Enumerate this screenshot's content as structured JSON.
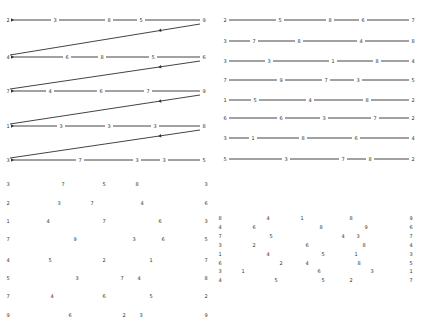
{
  "panels": {
    "top_left": {
      "type": "linked-rows-with-return-arrows",
      "rows": [
        {
          "y": 20,
          "digits": [
            "2",
            "3",
            "8",
            "5",
            "9"
          ],
          "x": [
            8,
            55,
            109,
            141,
            204
          ]
        },
        {
          "y": 57,
          "digits": [
            "4",
            "6",
            "8",
            "5",
            "6"
          ],
          "x": [
            8,
            67,
            102,
            153,
            204
          ]
        },
        {
          "y": 91,
          "digits": [
            "7",
            "4",
            "6",
            "7",
            "9"
          ],
          "x": [
            8,
            50,
            101,
            148,
            204
          ]
        },
        {
          "y": 126,
          "digits": [
            "1",
            "3",
            "3",
            "3",
            "8"
          ],
          "x": [
            8,
            61,
            109,
            155,
            204
          ]
        },
        {
          "y": 160,
          "digits": [
            "3",
            "7",
            "3",
            "3",
            "5"
          ],
          "x": [
            8,
            80,
            137,
            164,
            204
          ]
        }
      ]
    },
    "top_right": {
      "type": "linked-rows",
      "rows": [
        {
          "y": 20,
          "digits": [
            "2",
            "5",
            "8",
            "6",
            "7"
          ],
          "x": [
            10,
            65,
            115,
            148,
            198
          ]
        },
        {
          "y": 41,
          "digits": [
            "3",
            "7",
            "8",
            "4",
            "8"
          ],
          "x": [
            10,
            39,
            84,
            146,
            198
          ]
        },
        {
          "y": 61,
          "digits": [
            "3",
            "3",
            "1",
            "8",
            "4"
          ],
          "x": [
            10,
            54,
            118,
            162,
            198
          ]
        },
        {
          "y": 80,
          "digits": [
            "7",
            "9",
            "7",
            "3",
            "5"
          ],
          "x": [
            10,
            66,
            111,
            143,
            198
          ]
        },
        {
          "y": 100,
          "digits": [
            "1",
            "5",
            "4",
            "8",
            "2"
          ],
          "x": [
            10,
            40,
            95,
            152,
            198
          ]
        },
        {
          "y": 118,
          "digits": [
            "6",
            "6",
            "3",
            "7",
            "2"
          ],
          "x": [
            10,
            66,
            109,
            160,
            198
          ]
        },
        {
          "y": 138,
          "digits": [
            "3",
            "1",
            "8",
            "6",
            "4"
          ],
          "x": [
            10,
            38,
            88,
            141,
            198
          ]
        },
        {
          "y": 159,
          "digits": [
            "5",
            "3",
            "7",
            "8",
            "2"
          ],
          "x": [
            10,
            71,
            128,
            155,
            198
          ]
        }
      ]
    },
    "bottom_left": {
      "type": "scattered-digits",
      "items": [
        {
          "t": "3",
          "x": 8,
          "y": 14
        },
        {
          "t": "7",
          "x": 63,
          "y": 14
        },
        {
          "t": "5",
          "x": 104,
          "y": 14
        },
        {
          "t": "8",
          "x": 137,
          "y": 14
        },
        {
          "t": "3",
          "x": 206,
          "y": 14
        },
        {
          "t": "2",
          "x": 8,
          "y": 33
        },
        {
          "t": "3",
          "x": 59,
          "y": 33
        },
        {
          "t": "7",
          "x": 92,
          "y": 33
        },
        {
          "t": "4",
          "x": 142,
          "y": 33
        },
        {
          "t": "6",
          "x": 206,
          "y": 33
        },
        {
          "t": "1",
          "x": 8,
          "y": 51
        },
        {
          "t": "4",
          "x": 48,
          "y": 51
        },
        {
          "t": "7",
          "x": 104,
          "y": 51
        },
        {
          "t": "6",
          "x": 160,
          "y": 51
        },
        {
          "t": "3",
          "x": 206,
          "y": 51
        },
        {
          "t": "7",
          "x": 8,
          "y": 69
        },
        {
          "t": "9",
          "x": 75,
          "y": 69
        },
        {
          "t": "3",
          "x": 134,
          "y": 69
        },
        {
          "t": "6",
          "x": 163,
          "y": 69
        },
        {
          "t": "5",
          "x": 206,
          "y": 69
        },
        {
          "t": "4",
          "x": 8,
          "y": 90
        },
        {
          "t": "5",
          "x": 50,
          "y": 90
        },
        {
          "t": "2",
          "x": 104,
          "y": 90
        },
        {
          "t": "1",
          "x": 151,
          "y": 90
        },
        {
          "t": "7",
          "x": 206,
          "y": 90
        },
        {
          "t": "5",
          "x": 8,
          "y": 108
        },
        {
          "t": "3",
          "x": 77,
          "y": 108
        },
        {
          "t": "7",
          "x": 122,
          "y": 108
        },
        {
          "t": "4",
          "x": 139,
          "y": 108
        },
        {
          "t": "8",
          "x": 206,
          "y": 108
        },
        {
          "t": "7",
          "x": 8,
          "y": 126
        },
        {
          "t": "4",
          "x": 52,
          "y": 126
        },
        {
          "t": "6",
          "x": 104,
          "y": 126
        },
        {
          "t": "5",
          "x": 151,
          "y": 126
        },
        {
          "t": "2",
          "x": 206,
          "y": 126
        },
        {
          "t": "9",
          "x": 8,
          "y": 145
        },
        {
          "t": "6",
          "x": 70,
          "y": 145
        },
        {
          "t": "2",
          "x": 124,
          "y": 145
        },
        {
          "t": "3",
          "x": 141,
          "y": 145
        },
        {
          "t": "9",
          "x": 206,
          "y": 145
        }
      ]
    },
    "bottom_right": {
      "type": "scattered-digits",
      "items": [
        {
          "t": "8",
          "x": 5,
          "y": 48
        },
        {
          "t": "4",
          "x": 53,
          "y": 48
        },
        {
          "t": "1",
          "x": 87,
          "y": 48
        },
        {
          "t": "8",
          "x": 136,
          "y": 48
        },
        {
          "t": "9",
          "x": 196,
          "y": 48
        },
        {
          "t": "4",
          "x": 5,
          "y": 57
        },
        {
          "t": "6",
          "x": 39,
          "y": 57
        },
        {
          "t": "8",
          "x": 106,
          "y": 57
        },
        {
          "t": "9",
          "x": 151,
          "y": 57
        },
        {
          "t": "6",
          "x": 196,
          "y": 57
        },
        {
          "t": "7",
          "x": 5,
          "y": 66
        },
        {
          "t": "5",
          "x": 56,
          "y": 66
        },
        {
          "t": "4",
          "x": 128,
          "y": 66
        },
        {
          "t": "3",
          "x": 143,
          "y": 66
        },
        {
          "t": "7",
          "x": 196,
          "y": 66
        },
        {
          "t": "3",
          "x": 5,
          "y": 75
        },
        {
          "t": "2",
          "x": 39,
          "y": 75
        },
        {
          "t": "6",
          "x": 92,
          "y": 75
        },
        {
          "t": "8",
          "x": 149,
          "y": 75
        },
        {
          "t": "4",
          "x": 196,
          "y": 75
        },
        {
          "t": "1",
          "x": 5,
          "y": 84
        },
        {
          "t": "4",
          "x": 53,
          "y": 84
        },
        {
          "t": "5",
          "x": 108,
          "y": 84
        },
        {
          "t": "1",
          "x": 141,
          "y": 84
        },
        {
          "t": "3",
          "x": 196,
          "y": 84
        },
        {
          "t": "6",
          "x": 5,
          "y": 93
        },
        {
          "t": "2",
          "x": 66,
          "y": 93
        },
        {
          "t": "4",
          "x": 92,
          "y": 93
        },
        {
          "t": "8",
          "x": 144,
          "y": 93
        },
        {
          "t": "5",
          "x": 196,
          "y": 93
        },
        {
          "t": "3",
          "x": 5,
          "y": 101
        },
        {
          "t": "1",
          "x": 28,
          "y": 101
        },
        {
          "t": "6",
          "x": 104,
          "y": 101
        },
        {
          "t": "3",
          "x": 157,
          "y": 101
        },
        {
          "t": "1",
          "x": 196,
          "y": 101
        },
        {
          "t": "4",
          "x": 5,
          "y": 110
        },
        {
          "t": "5",
          "x": 61,
          "y": 110
        },
        {
          "t": "5",
          "x": 108,
          "y": 110
        },
        {
          "t": "2",
          "x": 136,
          "y": 110
        },
        {
          "t": "7",
          "x": 196,
          "y": 110
        }
      ]
    }
  }
}
